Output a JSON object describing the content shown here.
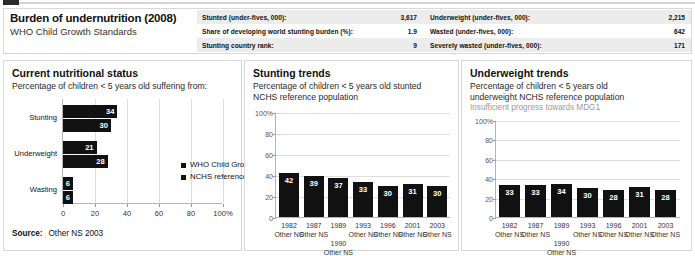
{
  "header": {
    "title": "Burden of undernutrition (2008)",
    "subtitle": "WHO Child Growth Standards",
    "stats": [
      {
        "label": "Stunted (under-fives, 000):",
        "value": "3,617"
      },
      {
        "label": "Underweight (under-fives, 000):",
        "value": "2,215"
      },
      {
        "label": "Share of developing world stunting burden (%):",
        "value": "1.9"
      },
      {
        "label": "Wasted (under-fives, 000):",
        "value": "642"
      },
      {
        "label": "Stunting country rank:",
        "value": "9"
      },
      {
        "label": "Severely wasted (under-fives, 000):",
        "value": "171"
      }
    ]
  },
  "panel1": {
    "title": "Current nutritional status",
    "subtitle": "Percentage of children < 5 years old suffering from:",
    "legend": [
      "WHO Child Growth Standards",
      "NCHS reference population"
    ],
    "source_label": "Source:",
    "source_value": "Other NS 2003"
  },
  "panel2": {
    "title": "Stunting trends",
    "subtitle_line1": "Percentage of children < 5 years old stunted",
    "subtitle_line2": "NCHS reference population"
  },
  "panel3": {
    "title": "Underweight trends",
    "subtitle_line1": "Percentage of children < 5 years old",
    "subtitle_line2": "underweight NCHS reference population",
    "note": "Insufficient progress towards MDG1"
  },
  "chart_data": [
    {
      "id": "current-nutritional-status",
      "type": "bar",
      "orientation": "horizontal",
      "title": "Current nutritional status",
      "subtitle": "Percentage of children < 5 years old suffering from:",
      "categories": [
        "Stunting",
        "Underweight",
        "Wasting"
      ],
      "series": [
        {
          "name": "WHO Child Growth Standards",
          "values": [
            34,
            21,
            6
          ]
        },
        {
          "name": "NCHS reference population",
          "values": [
            30,
            28,
            6
          ]
        }
      ],
      "xlabel": "",
      "ylabel": "",
      "xlim": [
        0,
        100
      ],
      "xticks": [
        0,
        20,
        40,
        60,
        80,
        100
      ],
      "xticklabels": [
        "0",
        "20",
        "40",
        "60",
        "80",
        "100%"
      ],
      "grid": true,
      "legend_position": "inside-right",
      "bar_color": "#111111"
    },
    {
      "id": "stunting-trends",
      "type": "bar",
      "orientation": "vertical",
      "title": "Stunting trends",
      "subtitle": "Percentage of children < 5 years old stunted NCHS reference population",
      "categories": [
        "1982",
        "1987",
        "1989\n1990",
        "1993",
        "1996",
        "2001",
        "2003"
      ],
      "category_sources": [
        "Other NS",
        "Other NS",
        "Other NS",
        "Other NS",
        "Other NS",
        "Other NS",
        "Other NS"
      ],
      "values": [
        42,
        39,
        37,
        33,
        30,
        31,
        30
      ],
      "xlabel": "",
      "ylabel": "",
      "ylim": [
        0,
        100
      ],
      "yticks": [
        0,
        20,
        40,
        60,
        80,
        100
      ],
      "yticklabels": [
        "0",
        "20",
        "40",
        "60",
        "80",
        "100%"
      ],
      "grid": true,
      "bar_color": "#111111"
    },
    {
      "id": "underweight-trends",
      "type": "bar",
      "orientation": "vertical",
      "title": "Underweight trends",
      "subtitle": "Percentage of children < 5 years old underweight NCHS reference population",
      "annotation": "Insufficient progress towards MDG1",
      "categories": [
        "1982",
        "1987",
        "1989\n1990",
        "1993",
        "1996",
        "2001",
        "2003"
      ],
      "category_sources": [
        "Other NS",
        "Other NS",
        "Other NS",
        "Other NS",
        "Other NS",
        "Other NS",
        "Other NS"
      ],
      "values": [
        33,
        33,
        34,
        30,
        28,
        31,
        28
      ],
      "xlabel": "",
      "ylabel": "",
      "ylim": [
        0,
        100
      ],
      "yticks": [
        0,
        20,
        40,
        60,
        80,
        100
      ],
      "yticklabels": [
        "0",
        "20",
        "40",
        "60",
        "80",
        "100%"
      ],
      "grid": true,
      "bar_color": "#111111"
    }
  ]
}
